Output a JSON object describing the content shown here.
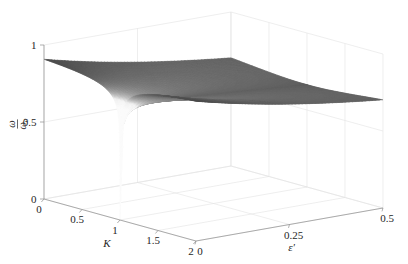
{
  "figure": {
    "kind": "surface-plot-3d",
    "background": "#ffffff",
    "ink_color": "#262626",
    "axis_color": "#8d8d8d",
    "grid_color": "#e2e2e2",
    "surface_dark": "#2e2e2e",
    "surface_light": "#f2f2f2"
  },
  "axes": {
    "z": {
      "label": "ω/ω₀",
      "label_parts": {
        "numerator": "ω",
        "denominator": "ω₀"
      },
      "ticks": [
        "0",
        "0.5",
        "1"
      ],
      "tick_values": [
        0,
        0.5,
        1
      ],
      "range": [
        0,
        1
      ]
    },
    "x": {
      "label": "K",
      "ticks": [
        "0",
        "0.5",
        "1",
        "1.5",
        "2"
      ],
      "tick_values": [
        0,
        0.5,
        1,
        1.5,
        2
      ],
      "range": [
        0,
        2
      ]
    },
    "y": {
      "label": "ε'",
      "ticks": [
        "0",
        "0.25",
        "0.5"
      ],
      "tick_values": [
        0,
        0.25,
        0.5
      ],
      "range": [
        0,
        0.5
      ]
    }
  },
  "chart_data": {
    "type": "surface",
    "title": "",
    "xlabel": "K",
    "ylabel": "ε'",
    "zlabel": "ω/ω₀",
    "xlim": [
      0,
      2
    ],
    "ylim": [
      0,
      0.5
    ],
    "zlim": [
      0,
      1
    ],
    "xticks": [
      0,
      0.5,
      1,
      1.5,
      2
    ],
    "yticks": [
      0,
      0.25,
      0.5
    ],
    "zticks": [
      0,
      0.5,
      1
    ],
    "grid": true,
    "legend": "none",
    "colormap": "gray",
    "shading": "interp",
    "view": {
      "azimuth": -37.5,
      "elevation": 30
    },
    "singularity": {
      "K": 1.0,
      "epsilon_prime": 0.0,
      "value": 0.0
    },
    "surface_formula_note": "z = ((K-1)^2 + e)^(1/4) / (((K-1)^2 + e)^(1/4) + c), normalized to 1 at the domain edges",
    "x": [
      0,
      0.1,
      0.2,
      0.3,
      0.4,
      0.5,
      0.6,
      0.7,
      0.8,
      0.9,
      0.95,
      1.0,
      1.05,
      1.1,
      1.2,
      1.3,
      1.4,
      1.5,
      1.6,
      1.7,
      1.8,
      1.9,
      2.0
    ],
    "y": [
      0,
      0.05,
      0.1,
      0.15,
      0.2,
      0.25,
      0.3,
      0.35,
      0.4,
      0.45,
      0.5
    ],
    "z_samples": [
      {
        "epsilon_prime": 0.0,
        "values": [
          1.0,
          0.99,
          0.98,
          0.96,
          0.93,
          0.9,
          0.85,
          0.79,
          0.7,
          0.55,
          0.42,
          0.0,
          0.42,
          0.55,
          0.7,
          0.79,
          0.85,
          0.9,
          0.93,
          0.96,
          0.98,
          0.99,
          1.0
        ]
      },
      {
        "epsilon_prime": 0.1,
        "values": [
          1.0,
          0.99,
          0.98,
          0.97,
          0.95,
          0.93,
          0.9,
          0.87,
          0.83,
          0.79,
          0.77,
          0.76,
          0.77,
          0.79,
          0.83,
          0.87,
          0.9,
          0.93,
          0.95,
          0.97,
          0.98,
          0.99,
          1.0
        ]
      },
      {
        "epsilon_prime": 0.25,
        "values": [
          1.0,
          1.0,
          0.99,
          0.98,
          0.97,
          0.96,
          0.95,
          0.93,
          0.92,
          0.91,
          0.9,
          0.9,
          0.9,
          0.91,
          0.92,
          0.93,
          0.95,
          0.96,
          0.97,
          0.98,
          0.99,
          1.0,
          1.0
        ]
      },
      {
        "epsilon_prime": 0.5,
        "values": [
          1.0,
          1.0,
          1.0,
          0.99,
          0.99,
          0.98,
          0.98,
          0.97,
          0.96,
          0.96,
          0.96,
          0.95,
          0.96,
          0.96,
          0.96,
          0.97,
          0.98,
          0.98,
          0.99,
          0.99,
          1.0,
          1.0,
          1.0
        ]
      }
    ]
  }
}
